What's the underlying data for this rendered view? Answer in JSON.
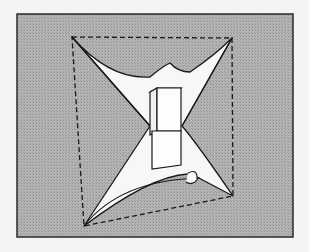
{
  "figure": {
    "colors": {
      "page": "#f4f4f4",
      "panel": "#a9a9a9",
      "membrane": "#f7f7f7",
      "line": "#1a1a1a"
    },
    "panel": {
      "x": 17,
      "y": 14,
      "width": 276,
      "height": 223
    },
    "dashed_frame": {
      "corners": [
        [
          72,
          37
        ],
        [
          232,
          38
        ],
        [
          233,
          196
        ],
        [
          84,
          226
        ]
      ]
    },
    "block": {
      "label": ""
    }
  }
}
